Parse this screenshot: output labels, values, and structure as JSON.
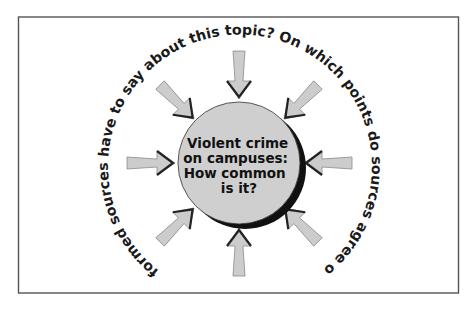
{
  "diagram": {
    "title": "Violent crime on campuses: How common is it?",
    "center": {
      "lines": [
        "Violent crime",
        "on campuses:",
        "How common",
        "is it?"
      ]
    },
    "ring_text": "What do informed sources have to say about this topic? On which points do sources agree or disagree?",
    "arrows": [
      {
        "direction": "top"
      },
      {
        "direction": "top-right"
      },
      {
        "direction": "right"
      },
      {
        "direction": "bottom-right"
      },
      {
        "direction": "bottom"
      },
      {
        "direction": "bottom-left"
      },
      {
        "direction": "left"
      },
      {
        "direction": "top-left"
      }
    ],
    "colors": {
      "frame": "#555555",
      "circle_fill": "#cfcfcf",
      "circle_shadow": "#111111",
      "arrow_fill": "#cccccc",
      "arrow_outline": "#8a8a8a",
      "arrow_head": "#222222",
      "text": "#1a1a1a"
    }
  }
}
